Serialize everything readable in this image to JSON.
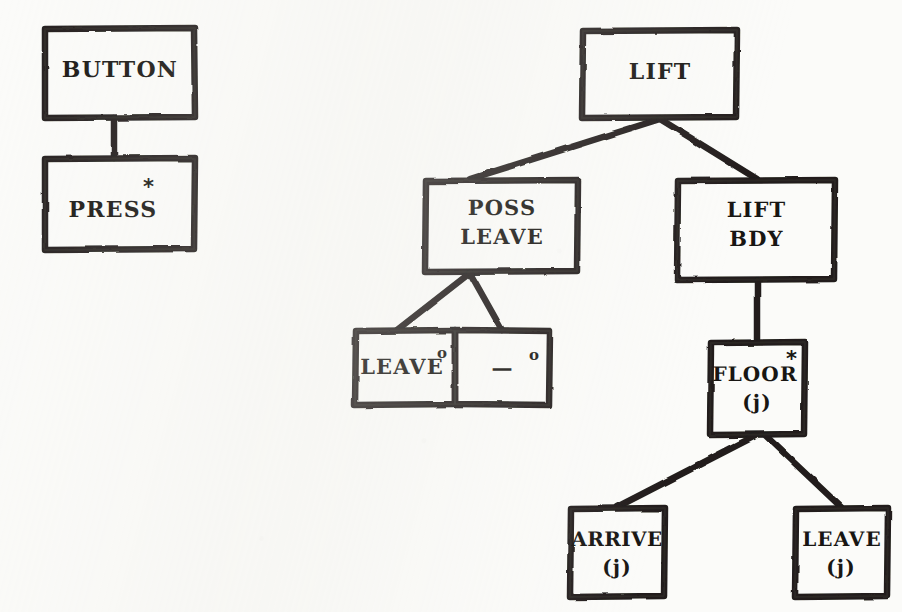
{
  "diagram": {
    "ink_color": "#201e1b",
    "paper_color": "#fbfbf9",
    "trees": [
      {
        "name": "button-tree",
        "root": "BUTTON",
        "nodes": [
          {
            "id": "button",
            "label": "BUTTON",
            "marker": "",
            "kind": "root"
          },
          {
            "id": "press",
            "label": "PRESS",
            "marker": "*",
            "kind": "iteration"
          }
        ]
      },
      {
        "name": "lift-tree",
        "root": "LIFT",
        "nodes": [
          {
            "id": "lift",
            "label": "LIFT",
            "marker": "",
            "kind": "root"
          },
          {
            "id": "poss-leave",
            "label": "POSS\nLEAVE",
            "marker": "",
            "kind": "sequence"
          },
          {
            "id": "lift-bdy",
            "label": "LIFT\nBDY",
            "marker": "",
            "kind": "sequence"
          },
          {
            "id": "leave-sel",
            "label": "LEAVE",
            "marker": "o",
            "kind": "selection"
          },
          {
            "id": "null-sel",
            "label": "—",
            "marker": "o",
            "kind": "selection-null"
          },
          {
            "id": "floor-j",
            "label": "FLOOR\n(j)",
            "marker": "*",
            "kind": "iteration"
          },
          {
            "id": "arrive-j",
            "label": "ARRIVE\n(j)",
            "marker": "",
            "kind": "leaf"
          },
          {
            "id": "leave-j",
            "label": "LEAVE\n(j)",
            "marker": "",
            "kind": "leaf"
          }
        ]
      }
    ]
  },
  "boxes": {
    "button": {
      "text_line1": "BUTTON",
      "text_line2": ""
    },
    "press": {
      "text_line1": "PRESS",
      "text_line2": "",
      "marker": "*"
    },
    "lift": {
      "text_line1": "LIFT",
      "text_line2": ""
    },
    "poss_leave": {
      "text_line1": "POSS",
      "text_line2": "LEAVE"
    },
    "lift_bdy": {
      "text_line1": "LIFT",
      "text_line2": "BDY"
    },
    "leave_sel": {
      "text_line1": "LEAVE",
      "text_line2": "",
      "marker": "o"
    },
    "null_sel": {
      "text_line1": "—",
      "text_line2": "",
      "marker": "o"
    },
    "floor_j": {
      "text_line1": "FLOOR",
      "text_line2": "(j)",
      "marker": "*"
    },
    "arrive_j": {
      "text_line1": "ARRIVE",
      "text_line2": "(j)"
    },
    "leave_j": {
      "text_line1": "LEAVE",
      "text_line2": "(j)"
    }
  }
}
